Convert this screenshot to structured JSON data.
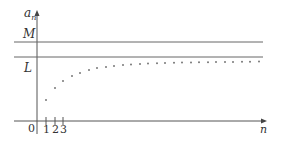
{
  "diagram": {
    "type": "sequence-convergence",
    "y_axis_label": "a",
    "y_axis_subscript": "n",
    "x_axis_label": "n",
    "origin_label": "0",
    "tick_labels": [
      "1",
      "2",
      "3"
    ],
    "horizontal_lines": [
      {
        "label": "M",
        "meaning": "upper bound"
      },
      {
        "label": "L",
        "meaning": "limit"
      }
    ],
    "colors": {
      "axis": "#555555",
      "line": "#666666",
      "dot": "#777777",
      "text": "#333333"
    }
  },
  "chart_data": {
    "type": "scatter",
    "title": "",
    "xlabel": "n",
    "ylabel": "a_n",
    "reference_lines": [
      {
        "label": "M",
        "y_pixel": 42
      },
      {
        "label": "L",
        "y_pixel": 57
      }
    ],
    "points_pixel": [
      [
        46,
        100
      ],
      [
        55,
        88
      ],
      [
        63,
        81
      ],
      [
        72,
        76
      ],
      [
        80,
        73
      ],
      [
        89,
        70
      ],
      [
        97,
        68
      ],
      [
        106,
        67
      ],
      [
        114,
        66
      ],
      [
        123,
        65
      ],
      [
        131,
        64.5
      ],
      [
        140,
        64
      ],
      [
        148,
        63.6
      ],
      [
        157,
        63.3
      ],
      [
        165,
        63
      ],
      [
        174,
        62.8
      ],
      [
        182,
        62.6
      ],
      [
        191,
        62.4
      ],
      [
        199,
        62.3
      ],
      [
        208,
        62.2
      ],
      [
        216,
        62.1
      ],
      [
        225,
        62
      ],
      [
        233,
        61.9
      ],
      [
        242,
        61.8
      ],
      [
        250,
        61.7
      ],
      [
        259,
        61.6
      ]
    ],
    "x_ticks": [
      "1",
      "2",
      "3"
    ],
    "grid": false,
    "legend": false
  }
}
